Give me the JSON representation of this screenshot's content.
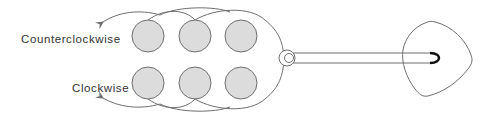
{
  "labels": {
    "counterclockwise": "Counterclockwise",
    "clockwise": "Clockwise"
  },
  "colors": {
    "disc_fill": "#dcdcdc",
    "stroke": "#6e6e6e",
    "text": "#333333",
    "rod_cap": "#111111"
  },
  "discs": {
    "top_row": [
      {
        "cx": 148,
        "cy": 36
      },
      {
        "cx": 195,
        "cy": 36
      },
      {
        "cx": 241,
        "cy": 36
      }
    ],
    "bottom_row": [
      {
        "cx": 148,
        "cy": 83
      },
      {
        "cx": 195,
        "cy": 83
      },
      {
        "cx": 241,
        "cy": 83
      }
    ],
    "radius": 16
  },
  "pivot": {
    "cx": 287,
    "cy": 58,
    "outer_r": 8,
    "inner_r": 4.5
  },
  "rod": {
    "x1": 293,
    "x2": 432,
    "y_top": 53,
    "y_bottom": 63
  },
  "pick": {
    "x_min": 403,
    "x_max": 472,
    "y_min": 22,
    "y_max": 96
  }
}
